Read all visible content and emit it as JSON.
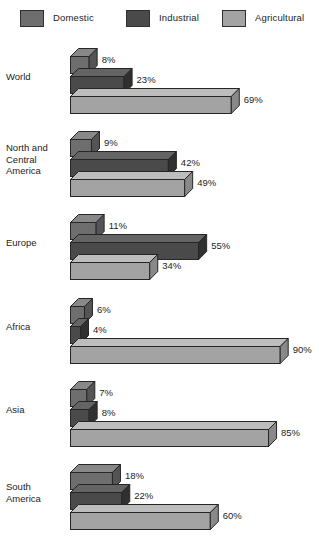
{
  "chart": {
    "type": "bar",
    "title": "",
    "legend_position": "top"
  },
  "legend": {
    "items": [
      {
        "label": "Domestic",
        "color": "#6e6e6e"
      },
      {
        "label": "Industrial",
        "color": "#4a4a4a"
      },
      {
        "label": "Agricultural",
        "color": "#a3a3a3"
      }
    ]
  },
  "chart_data": {
    "type": "bar",
    "orientation": "horizontal",
    "title": "",
    "subtitle": "",
    "xlabel": "",
    "ylabel": "",
    "xlim": [
      0,
      100
    ],
    "grid": false,
    "legend_position": "top",
    "value_suffix": "%",
    "categories": [
      "World",
      "North and Central America",
      "Europe",
      "Africa",
      "Asia",
      "South America"
    ],
    "series": [
      {
        "name": "Domestic",
        "color": "#6e6e6e",
        "values": [
          8,
          9,
          11,
          6,
          7,
          18
        ]
      },
      {
        "name": "Industrial",
        "color": "#4a4a4a",
        "values": [
          23,
          42,
          55,
          4,
          8,
          22
        ]
      },
      {
        "name": "Agricultural",
        "color": "#a3a3a3",
        "values": [
          69,
          49,
          34,
          90,
          85,
          60
        ]
      }
    ],
    "annotations": [
      "World: Domestic 8%, Industrial 23%, Agricultural 69%",
      "North and Central America: Domestic 9%, Industrial 42%, Agricultural 49%",
      "Europe: Domestic 11%, Industrial 55%, Agricultural 34%",
      "Africa: Domestic 6%, Industrial 4%, Agricultural 90%",
      "Asia: Domestic 7%, Industrial 8%, Agricultural 85%",
      "South America: Domestic 18%, Industrial 22%, Agricultural 60%"
    ]
  },
  "groups": [
    {
      "label": "World",
      "label_lines": "World",
      "bars": [
        {
          "series": "Domestic",
          "value": 8,
          "value_label": "8%"
        },
        {
          "series": "Industrial",
          "value": 23,
          "value_label": "23%"
        },
        {
          "series": "Agricultural",
          "value": 69,
          "value_label": "69%"
        }
      ]
    },
    {
      "label": "North and Central America",
      "label_lines": "North and\nCentral\nAmerica",
      "bars": [
        {
          "series": "Domestic",
          "value": 9,
          "value_label": "9%"
        },
        {
          "series": "Industrial",
          "value": 42,
          "value_label": "42%"
        },
        {
          "series": "Agricultural",
          "value": 49,
          "value_label": "49%"
        }
      ]
    },
    {
      "label": "Europe",
      "label_lines": "Europe",
      "bars": [
        {
          "series": "Domestic",
          "value": 11,
          "value_label": "11%"
        },
        {
          "series": "Industrial",
          "value": 55,
          "value_label": "55%"
        },
        {
          "series": "Agricultural",
          "value": 34,
          "value_label": "34%"
        }
      ]
    },
    {
      "label": "Africa",
      "label_lines": "Africa",
      "bars": [
        {
          "series": "Domestic",
          "value": 6,
          "value_label": "6%"
        },
        {
          "series": "Industrial",
          "value": 4,
          "value_label": "4%"
        },
        {
          "series": "Agricultural",
          "value": 90,
          "value_label": "90%"
        }
      ]
    },
    {
      "label": "Asia",
      "label_lines": "Asia",
      "bars": [
        {
          "series": "Domestic",
          "value": 7,
          "value_label": "7%"
        },
        {
          "series": "Industrial",
          "value": 8,
          "value_label": "8%"
        },
        {
          "series": "Agricultural",
          "value": 85,
          "value_label": "85%"
        }
      ]
    },
    {
      "label": "South America",
      "label_lines": "South\nAmerica",
      "bars": [
        {
          "series": "Domestic",
          "value": 18,
          "value_label": "18%"
        },
        {
          "series": "Industrial",
          "value": 22,
          "value_label": "22%"
        },
        {
          "series": "Agricultural",
          "value": 60,
          "value_label": "60%"
        }
      ]
    }
  ]
}
